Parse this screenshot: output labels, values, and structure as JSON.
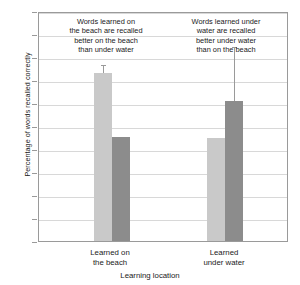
{
  "chart_data": {
    "type": "bar",
    "title": "",
    "xlabel": "Learning location",
    "ylabel": "Percentage of words recalled correctly",
    "ylim": [
      0,
      50
    ],
    "yticks": [
      0,
      5,
      10,
      15,
      20,
      25,
      30,
      35,
      40,
      45,
      50
    ],
    "grid": true,
    "legend_position": "none",
    "categories": [
      "Learned on the beach",
      "Learned under water"
    ],
    "series": [
      {
        "name": "Recalled on the beach",
        "color": "#c9c9c9",
        "values": [
          36.5,
          22.3
        ],
        "errors": [
          1.5,
          0
        ]
      },
      {
        "name": "Recalled under water",
        "color": "#8c8c8c",
        "values": [
          22.7,
          30.5
        ],
        "errors": [
          0,
          11.5
        ]
      }
    ],
    "annotations": [
      "Words learned on\nthe beach are recalled\nbetter on the beach\nthan under water",
      "Words learned under\nwater are recalled\nbetter under water\nthan on the beach"
    ]
  },
  "axis": {
    "y_title": "Percentage of words recalled correctly",
    "x_title": "Learning location",
    "tick_labels": [
      "50",
      "45",
      "40",
      "35",
      "30",
      "25",
      "20",
      "15",
      "10",
      "5",
      "0"
    ]
  },
  "groups": [
    {
      "line1": "Learned on",
      "line2": "the beach"
    },
    {
      "line1": "Learned",
      "line2": "under water"
    }
  ],
  "annotations": [
    {
      "l1": "Words learned on",
      "l2": "the beach are recalled",
      "l3": "better on the beach",
      "l4": "than under water"
    },
    {
      "l1": "Words learned under",
      "l2": "water are recalled",
      "l3": "better under water",
      "l4": "than on the beach"
    }
  ],
  "colors": {
    "bar_light": "#c9c9c9",
    "bar_dark": "#8c8c8c",
    "gridline": "#d8d8d8",
    "frame": "#9a9a9a",
    "text": "#1a1a1a"
  }
}
